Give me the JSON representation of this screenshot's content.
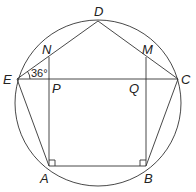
{
  "diagram": {
    "type": "geometry",
    "colors": {
      "stroke": "#333333",
      "background": "#ffffff"
    },
    "circle": {
      "cx": 98,
      "cy": 103,
      "r": 83
    },
    "points": {
      "A": {
        "label": "A",
        "x": 49,
        "y": 166
      },
      "B": {
        "label": "B",
        "x": 146,
        "y": 166
      },
      "C": {
        "label": "C",
        "x": 178,
        "y": 79
      },
      "D": {
        "label": "D",
        "x": 98,
        "y": 21
      },
      "E": {
        "label": "E",
        "x": 17,
        "y": 79
      },
      "N": {
        "label": "N",
        "x": 49,
        "y": 57
      },
      "M": {
        "label": "M",
        "x": 146,
        "y": 57
      },
      "P": {
        "label": "P",
        "x": 49,
        "y": 79
      },
      "Q": {
        "label": "Q",
        "x": 146,
        "y": 79
      }
    },
    "segments": [
      "AB",
      "BC",
      "CD",
      "DE",
      "EA",
      "EC",
      "AN",
      "BM"
    ],
    "angle_annotation": {
      "at": "E",
      "between": [
        "ED",
        "EC"
      ],
      "value": "36°"
    },
    "right_angles": [
      "A",
      "B"
    ]
  }
}
